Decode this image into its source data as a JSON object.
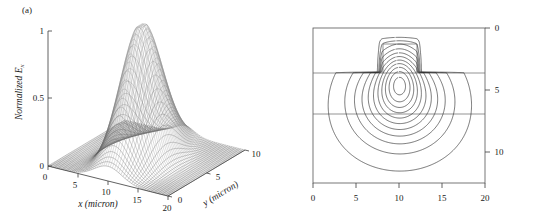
{
  "figure": {
    "panels": [
      {
        "id": "a",
        "label": "(a)",
        "type": "surface-3d"
      },
      {
        "id": "b",
        "label": "(b)",
        "type": "contour"
      }
    ]
  },
  "panel_a": {
    "label": "(a)",
    "zlabel": "Normalized E",
    "zlabel_sub": "x",
    "xlabel": "x (micron)",
    "ylabel": "y (micron)",
    "z_ticks": [
      "0",
      "0.5",
      "1"
    ],
    "x_ticks": [
      "0",
      "5",
      "10",
      "15",
      "20"
    ],
    "y_ticks": [
      "0",
      "5",
      "10"
    ]
  },
  "panel_b": {
    "label": "(b)",
    "x_ticks": [
      "0",
      "5",
      "10",
      "15",
      "20"
    ],
    "y_ticks": [
      "0",
      "5",
      "10"
    ]
  },
  "chart_data": [
    {
      "type": "surface",
      "panel": "a",
      "title": "",
      "xlabel": "x (micron)",
      "ylabel": "y (micron)",
      "zlabel": "Normalized E_x",
      "xlim": [
        0,
        20
      ],
      "ylim": [
        0,
        10
      ],
      "zlim": [
        0,
        1
      ],
      "xticks": [
        0,
        5,
        10,
        15,
        20
      ],
      "yticks": [
        0,
        5,
        10
      ],
      "zticks": [
        0,
        0.5,
        1
      ],
      "grid": false,
      "legend": "none",
      "rendering": "wireframe-mesh",
      "description": "Normalized electric field amplitude of the fundamental guided mode of a rib waveguide, peaking at approximately 1.0 near x = 10 micron, y = 4 micron, decaying to near 0 at the edges of the computational window.",
      "peak": {
        "x": 10,
        "y": 4,
        "z": 1.0
      },
      "surface_model": {
        "form": "asymmetric-gaussian",
        "x0": 10.0,
        "y0": 4.2,
        "sigma_x": 3.0,
        "sigma_y": 2.6,
        "amplitude": 1.0
      }
    },
    {
      "type": "contour",
      "panel": "b",
      "title": "",
      "xlabel": "",
      "ylabel": "",
      "xlim": [
        0,
        20
      ],
      "ylim": [
        0,
        12.5
      ],
      "xticks": [
        0,
        5,
        10,
        15,
        20
      ],
      "yticks": [
        0,
        5,
        10
      ],
      "y_axis_position": "right",
      "y_axis_direction": "inverted",
      "grid": false,
      "legend": "none",
      "n_levels": 11,
      "levels": [
        0.05,
        0.14,
        0.23,
        0.32,
        0.41,
        0.5,
        0.59,
        0.68,
        0.77,
        0.86,
        0.95
      ],
      "description": "Contour map of the normalized field in the waveguide cross-section. A rectangular rib sits on top of a slab; two horizontal lines mark the layer interfaces. Contours are concentric, centered near x = 10 micron, depth 5.5 micron, extending into the rib above.",
      "structure": {
        "rib": {
          "x_left": 8.1,
          "x_right": 12.0,
          "y_top": 1.3,
          "y_bottom": 3.6
        },
        "interfaces_y": [
          3.6,
          6.9
        ],
        "center": {
          "x": 10.1,
          "y": 5.3
        }
      }
    }
  ]
}
